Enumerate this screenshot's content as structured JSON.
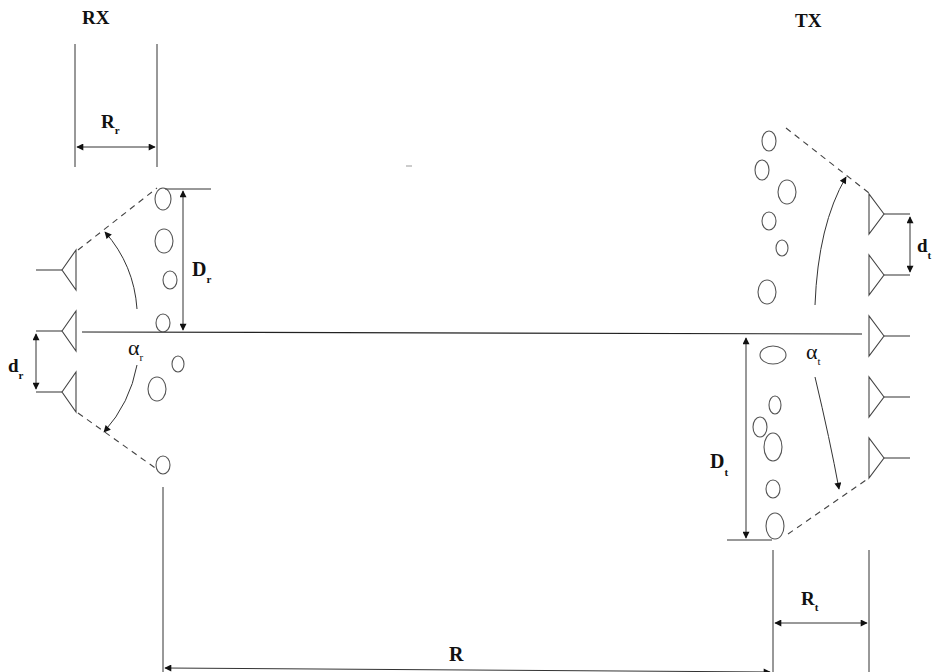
{
  "diagram": {
    "labels": {
      "rx": "RX",
      "tx": "TX",
      "R_r_main": "R",
      "R_r_sub": "r",
      "D_r_main": "D",
      "D_r_sub": "r",
      "d_r_main": "d",
      "d_r_sub": "r",
      "alpha_r_main": "α",
      "alpha_r_sub": "r",
      "R_t_main": "R",
      "R_t_sub": "t",
      "D_t_main": "D",
      "D_t_sub": "t",
      "d_t_main": "d",
      "d_t_sub": "t",
      "alpha_t_main": "α",
      "alpha_t_sub": "t",
      "R": "R"
    },
    "rx": {
      "antenna_count": 3,
      "antennas_y": [
        270,
        330,
        390
      ],
      "scatterers": [
        {
          "cx": 163,
          "cy": 199,
          "rx": 8,
          "ry": 11
        },
        {
          "cx": 164,
          "cy": 241,
          "rx": 9,
          "ry": 12
        },
        {
          "cx": 170,
          "cy": 280,
          "rx": 7,
          "ry": 9
        },
        {
          "cx": 163,
          "cy": 323,
          "rx": 7,
          "ry": 9
        },
        {
          "cx": 178,
          "cy": 364,
          "rx": 6,
          "ry": 8
        },
        {
          "cx": 157,
          "cy": 389,
          "rx": 9,
          "ry": 12
        },
        {
          "cx": 163,
          "cy": 465,
          "rx": 7,
          "ry": 9
        }
      ]
    },
    "tx": {
      "antenna_count": 5,
      "antennas_y": [
        214,
        275,
        336,
        397,
        458
      ],
      "scatterers": [
        {
          "cx": 769,
          "cy": 141,
          "rx": 7,
          "ry": 10
        },
        {
          "cx": 762,
          "cy": 170,
          "rx": 7,
          "ry": 10
        },
        {
          "cx": 787,
          "cy": 192,
          "rx": 9,
          "ry": 12
        },
        {
          "cx": 769,
          "cy": 221,
          "rx": 7,
          "ry": 9
        },
        {
          "cx": 782,
          "cy": 248,
          "rx": 6,
          "ry": 8
        },
        {
          "cx": 767,
          "cy": 292,
          "rx": 9,
          "ry": 12
        },
        {
          "cx": 773,
          "cy": 355,
          "rx": 13,
          "ry": 9
        },
        {
          "cx": 775,
          "cy": 405,
          "rx": 6,
          "ry": 9
        },
        {
          "cx": 760,
          "cy": 427,
          "rx": 7,
          "ry": 10
        },
        {
          "cx": 773,
          "cy": 447,
          "rx": 9,
          "ry": 14
        },
        {
          "cx": 773,
          "cy": 489,
          "rx": 7,
          "ry": 9
        },
        {
          "cx": 775,
          "cy": 526,
          "rx": 9,
          "ry": 13
        }
      ]
    },
    "colors": {
      "line": "#222222",
      "dashed": "#444444",
      "scatterer": "#555555",
      "background": "#ffffff"
    }
  }
}
